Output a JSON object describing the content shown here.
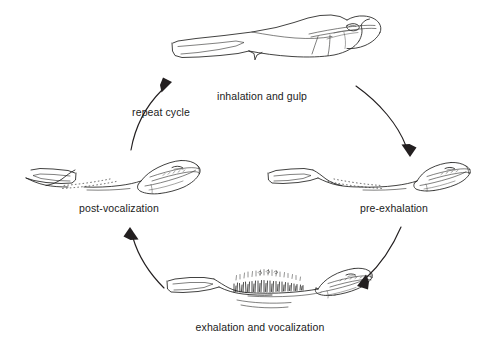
{
  "diagram": {
    "background_color": "#ffffff",
    "ink_color": "#231f20",
    "text_color": "#1b1b1b",
    "type": "cycle-diagram",
    "direction": "clockwise",
    "stage_count": 4
  },
  "stages": [
    {
      "id": "inhalation-and-gulp",
      "label": "inhalation and gulp",
      "position": "top",
      "label_x": 262,
      "label_y": 91,
      "description": "head in profile facing right with fully inflated vocal sac"
    },
    {
      "id": "pre-exhalation",
      "label": "pre-exhalation",
      "position": "right",
      "label_x": 394,
      "label_y": 203,
      "description": "head in profile facing right with deflated throat shown as dotted line"
    },
    {
      "id": "exhalation-and-vocalization",
      "label": "exhalation and vocalization",
      "position": "bottom",
      "label_x": 260,
      "label_y": 322,
      "description": "head in profile facing right with vibration strokes above throat"
    },
    {
      "id": "post-vocalization",
      "label": "post-vocalization",
      "position": "left",
      "label_x": 119,
      "label_y": 203,
      "description": "head in profile facing left with deflated throat shown as dotted line"
    }
  ],
  "arrows": [
    {
      "id": "arrow-top-right",
      "from_stage": "inhalation-and-gulp",
      "to_stage": "pre-exhalation",
      "label": ""
    },
    {
      "id": "arrow-bottom-right",
      "from_stage": "pre-exhalation",
      "to_stage": "exhalation-and-vocalization",
      "label": ""
    },
    {
      "id": "arrow-bottom-left",
      "from_stage": "exhalation-and-vocalization",
      "to_stage": "post-vocalization",
      "label": ""
    },
    {
      "id": "arrow-top-left",
      "from_stage": "post-vocalization",
      "to_stage": "inhalation-and-gulp",
      "label": "repeat cycle",
      "label_x": 161,
      "label_y": 113
    }
  ]
}
